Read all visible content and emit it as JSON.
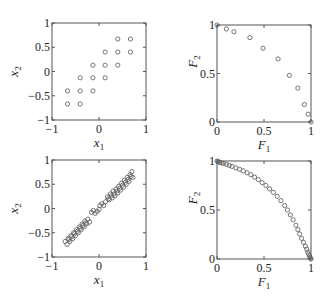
{
  "chart_data": [
    {
      "id": "top-left",
      "type": "scatter",
      "title": "",
      "xlabel": "x",
      "xlabel_sub": "1",
      "ylabel": "x",
      "ylabel_sub": "2",
      "xlim": [
        -1,
        1
      ],
      "ylim": [
        -1,
        1
      ],
      "xticks": [
        -1,
        0,
        1
      ],
      "xtick_labels": [
        "−1",
        "0",
        "1"
      ],
      "yticks": [
        -1,
        -0.5,
        0,
        0.5,
        1
      ],
      "ytick_labels": [
        "−1",
        "−0.5",
        "0",
        "0.5",
        "1"
      ],
      "grid": false,
      "box": {
        "x": 52,
        "y": 23,
        "w": 94,
        "h": 97
      },
      "marker": "circle-open",
      "points": [
        [
          0.4,
          0.67
        ],
        [
          0.67,
          0.67
        ],
        [
          0.13,
          0.4
        ],
        [
          0.4,
          0.4
        ],
        [
          0.67,
          0.4
        ],
        [
          -0.13,
          0.13
        ],
        [
          0.13,
          0.13
        ],
        [
          0.4,
          0.13
        ],
        [
          -0.4,
          -0.13
        ],
        [
          -0.13,
          -0.13
        ],
        [
          0.13,
          -0.13
        ],
        [
          -0.67,
          -0.4
        ],
        [
          -0.4,
          -0.4
        ],
        [
          -0.13,
          -0.4
        ],
        [
          -0.67,
          -0.67
        ],
        [
          -0.4,
          -0.67
        ]
      ]
    },
    {
      "id": "top-right",
      "type": "scatter",
      "title": "",
      "xlabel": "F",
      "xlabel_sub": "1",
      "ylabel": "F",
      "ylabel_sub": "2",
      "xlim": [
        0,
        1
      ],
      "ylim": [
        0,
        1
      ],
      "xticks": [
        0,
        0.5,
        1
      ],
      "xtick_labels": [
        "0",
        "0.5",
        "1"
      ],
      "yticks": [
        0,
        0.5,
        1
      ],
      "ytick_labels": [
        "0",
        "0.5",
        "1"
      ],
      "grid": false,
      "box": {
        "x": 217,
        "y": 25,
        "w": 94,
        "h": 97
      },
      "marker": "circle-open",
      "points": [
        [
          0.0,
          1.0
        ],
        [
          0.1,
          0.96
        ],
        [
          0.18,
          0.93
        ],
        [
          0.35,
          0.87
        ],
        [
          0.49,
          0.76
        ],
        [
          0.65,
          0.65
        ],
        [
          0.77,
          0.48
        ],
        [
          0.86,
          0.35
        ],
        [
          0.93,
          0.18
        ],
        [
          0.97,
          0.08
        ],
        [
          1.0,
          0.0
        ]
      ]
    },
    {
      "id": "bottom-left",
      "type": "scatter",
      "title": "",
      "xlabel": "x",
      "xlabel_sub": "1",
      "ylabel": "x",
      "ylabel_sub": "2",
      "xlim": [
        -1,
        1
      ],
      "ylim": [
        -1,
        1
      ],
      "xticks": [
        -1,
        0,
        1
      ],
      "xtick_labels": [
        "−1",
        "0",
        "1"
      ],
      "yticks": [
        -1,
        -0.5,
        0,
        0.5,
        1
      ],
      "ytick_labels": [
        "−1",
        "−0.5",
        "0",
        "0.5",
        "1"
      ],
      "grid": false,
      "box": {
        "x": 52,
        "y": 160,
        "w": 94,
        "h": 97
      },
      "marker": "circle-open",
      "points": [
        [
          -0.72,
          -0.68
        ],
        [
          -0.66,
          -0.62
        ],
        [
          -0.6,
          -0.56
        ],
        [
          -0.54,
          -0.5
        ],
        [
          -0.48,
          -0.44
        ],
        [
          -0.42,
          -0.38
        ],
        [
          -0.36,
          -0.32
        ],
        [
          -0.3,
          -0.26
        ],
        [
          -0.24,
          -0.22
        ],
        [
          -0.68,
          -0.74
        ],
        [
          -0.62,
          -0.68
        ],
        [
          -0.56,
          -0.62
        ],
        [
          -0.5,
          -0.56
        ],
        [
          -0.44,
          -0.5
        ],
        [
          -0.38,
          -0.44
        ],
        [
          -0.32,
          -0.38
        ],
        [
          -0.26,
          -0.32
        ],
        [
          -0.2,
          -0.28
        ],
        [
          -0.64,
          -0.64
        ],
        [
          -0.58,
          -0.58
        ],
        [
          -0.52,
          -0.52
        ],
        [
          -0.46,
          -0.47
        ],
        [
          -0.4,
          -0.41
        ],
        [
          -0.34,
          -0.35
        ],
        [
          -0.28,
          -0.3
        ],
        [
          -0.16,
          -0.08
        ],
        [
          -0.12,
          -0.04
        ],
        [
          -0.08,
          -0.1
        ],
        [
          -0.04,
          -0.06
        ],
        [
          0.0,
          -0.02
        ],
        [
          0.02,
          0.06
        ],
        [
          0.06,
          0.1
        ],
        [
          0.1,
          0.06
        ],
        [
          0.14,
          0.14
        ],
        [
          0.2,
          0.2
        ],
        [
          0.26,
          0.26
        ],
        [
          0.32,
          0.3
        ],
        [
          0.38,
          0.36
        ],
        [
          0.44,
          0.42
        ],
        [
          0.5,
          0.48
        ],
        [
          0.56,
          0.54
        ],
        [
          0.62,
          0.6
        ],
        [
          0.68,
          0.66
        ],
        [
          0.18,
          0.24
        ],
        [
          0.24,
          0.3
        ],
        [
          0.3,
          0.36
        ],
        [
          0.36,
          0.4
        ],
        [
          0.42,
          0.46
        ],
        [
          0.48,
          0.52
        ],
        [
          0.54,
          0.58
        ],
        [
          0.6,
          0.64
        ],
        [
          0.66,
          0.7
        ],
        [
          0.7,
          0.76
        ],
        [
          0.22,
          0.18
        ],
        [
          0.28,
          0.22
        ],
        [
          0.34,
          0.26
        ],
        [
          0.4,
          0.32
        ],
        [
          0.46,
          0.38
        ],
        [
          0.52,
          0.44
        ],
        [
          0.58,
          0.5
        ],
        [
          0.64,
          0.56
        ],
        [
          0.72,
          0.64
        ]
      ]
    },
    {
      "id": "bottom-right",
      "type": "scatter",
      "title": "",
      "xlabel": "F",
      "xlabel_sub": "1",
      "ylabel": "F",
      "ylabel_sub": "2",
      "xlim": [
        0,
        1
      ],
      "ylim": [
        0,
        1
      ],
      "xticks": [
        0,
        0.5,
        1
      ],
      "xtick_labels": [
        "0",
        "0.5",
        "1"
      ],
      "yticks": [
        0,
        0.5,
        1
      ],
      "ytick_labels": [
        "0",
        "0.5",
        "1"
      ],
      "grid": false,
      "box": {
        "x": 217,
        "y": 161,
        "w": 94,
        "h": 98
      },
      "marker": "circle-open",
      "points": [
        [
          0.0,
          1.0
        ],
        [
          0.01,
          0.995
        ],
        [
          0.02,
          0.99
        ],
        [
          0.03,
          0.985
        ],
        [
          0.05,
          0.98
        ],
        [
          0.07,
          0.975
        ],
        [
          0.1,
          0.965
        ],
        [
          0.13,
          0.955
        ],
        [
          0.16,
          0.945
        ],
        [
          0.2,
          0.93
        ],
        [
          0.24,
          0.915
        ],
        [
          0.28,
          0.9
        ],
        [
          0.32,
          0.88
        ],
        [
          0.36,
          0.86
        ],
        [
          0.4,
          0.835
        ],
        [
          0.44,
          0.81
        ],
        [
          0.48,
          0.78
        ],
        [
          0.52,
          0.75
        ],
        [
          0.56,
          0.715
        ],
        [
          0.6,
          0.68
        ],
        [
          0.64,
          0.64
        ],
        [
          0.68,
          0.595
        ],
        [
          0.72,
          0.545
        ],
        [
          0.75,
          0.5
        ],
        [
          0.78,
          0.45
        ],
        [
          0.81,
          0.4
        ],
        [
          0.84,
          0.345
        ],
        [
          0.86,
          0.3
        ],
        [
          0.88,
          0.255
        ],
        [
          0.9,
          0.21
        ],
        [
          0.92,
          0.17
        ],
        [
          0.94,
          0.13
        ],
        [
          0.955,
          0.1
        ],
        [
          0.965,
          0.07
        ],
        [
          0.975,
          0.05
        ],
        [
          0.985,
          0.03
        ],
        [
          0.99,
          0.015
        ],
        [
          0.995,
          0.005
        ],
        [
          1.0,
          0.0
        ]
      ]
    }
  ]
}
